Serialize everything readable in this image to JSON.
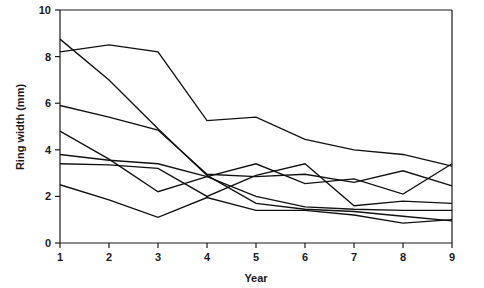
{
  "chart_data": {
    "type": "line",
    "title": "",
    "subtitle": "",
    "xlabel": "Year",
    "ylabel": "Ring width (mm)",
    "x": [
      1,
      2,
      3,
      4,
      5,
      6,
      7,
      8,
      9
    ],
    "xticklabels": [
      "1",
      "2",
      "3",
      "4",
      "5",
      "6",
      "7",
      "8",
      "9"
    ],
    "yticklabels": [
      "0",
      "2",
      "4",
      "6",
      "8",
      "10"
    ],
    "yticks": [
      0,
      2,
      4,
      6,
      8,
      10
    ],
    "xlim": [
      1,
      9
    ],
    "ylim": [
      0,
      10
    ],
    "grid": false,
    "legend": false,
    "legend_position": "none",
    "annotations": [],
    "series": [
      {
        "name": "tree-1",
        "values": [
          8.75,
          7.0,
          4.9,
          2.9,
          1.7,
          1.45,
          1.35,
          1.15,
          0.95
        ]
      },
      {
        "name": "tree-2",
        "values": [
          8.2,
          8.5,
          8.2,
          5.25,
          5.4,
          4.45,
          4.0,
          3.8,
          3.3
        ]
      },
      {
        "name": "tree-3",
        "values": [
          5.9,
          5.4,
          4.85,
          2.95,
          2.85,
          2.95,
          2.6,
          3.1,
          2.45
        ]
      },
      {
        "name": "tree-4",
        "values": [
          4.8,
          3.6,
          2.2,
          2.85,
          3.4,
          2.55,
          2.75,
          2.1,
          3.4
        ]
      },
      {
        "name": "tree-5",
        "values": [
          3.8,
          3.55,
          3.4,
          2.85,
          2.0,
          1.55,
          1.45,
          1.4,
          1.4
        ]
      },
      {
        "name": "tree-6",
        "values": [
          3.4,
          3.35,
          3.2,
          2.0,
          2.9,
          3.4,
          1.6,
          1.8,
          1.7
        ]
      },
      {
        "name": "tree-7",
        "values": [
          2.5,
          1.85,
          1.1,
          1.95,
          1.4,
          1.4,
          1.2,
          0.85,
          1.0
        ]
      }
    ]
  },
  "axes": {
    "x_axis_label": "Year",
    "y_axis_label": "Ring width (mm)"
  },
  "colors": {
    "line": "#111111",
    "axis": "#1a1a1a",
    "background": "#ffffff"
  }
}
